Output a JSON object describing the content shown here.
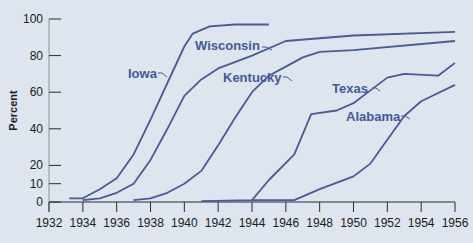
{
  "chart_data": {
    "type": "line",
    "title": "",
    "xlabel": "",
    "ylabel": "Percent",
    "xlim": [
      1932,
      1956
    ],
    "ylim": [
      0,
      100
    ],
    "x_ticks": [
      1932,
      1934,
      1936,
      1938,
      1940,
      1942,
      1944,
      1946,
      1948,
      1950,
      1952,
      1954,
      1956
    ],
    "y_ticks": [
      0,
      10,
      20,
      40,
      60,
      80,
      100
    ],
    "grid": false,
    "legend": "inline labels",
    "colors": {
      "line": "#4a5a94",
      "label": "#44589a",
      "axis": "#2a2a2a",
      "background": "#dfe5ee"
    },
    "series": [
      {
        "name": "Iowa",
        "points": [
          [
            1933.2,
            2
          ],
          [
            1934,
            2
          ],
          [
            1935,
            7
          ],
          [
            1936,
            13
          ],
          [
            1937,
            26
          ],
          [
            1938,
            45
          ],
          [
            1939,
            65
          ],
          [
            1940,
            85
          ],
          [
            1940.5,
            92
          ],
          [
            1941.5,
            96
          ],
          [
            1943,
            97
          ],
          [
            1945,
            97
          ]
        ],
        "label_pos": [
          128,
          78
        ]
      },
      {
        "name": "Wisconsin",
        "points": [
          [
            1934,
            1
          ],
          [
            1935,
            2
          ],
          [
            1936,
            5
          ],
          [
            1937,
            10
          ],
          [
            1938,
            23
          ],
          [
            1939,
            40
          ],
          [
            1940,
            58
          ],
          [
            1941,
            67
          ],
          [
            1942,
            73
          ],
          [
            1944,
            80
          ],
          [
            1946,
            88
          ],
          [
            1950,
            91
          ],
          [
            1956,
            93
          ]
        ],
        "label_pos": [
          195,
          50
        ]
      },
      {
        "name": "Kentucky",
        "points": [
          [
            1937,
            1
          ],
          [
            1938,
            2
          ],
          [
            1939,
            5
          ],
          [
            1940,
            10
          ],
          [
            1941,
            17
          ],
          [
            1942,
            31
          ],
          [
            1943,
            46
          ],
          [
            1944,
            60
          ],
          [
            1945,
            69
          ],
          [
            1946,
            74
          ],
          [
            1947,
            79
          ],
          [
            1948,
            82
          ],
          [
            1950,
            83
          ],
          [
            1956,
            88
          ]
        ],
        "label_pos": [
          223,
          82
        ]
      },
      {
        "name": "Texas",
        "points": [
          [
            1941,
            0.5
          ],
          [
            1944,
            1
          ],
          [
            1945,
            12
          ],
          [
            1946.5,
            26
          ],
          [
            1947.5,
            48
          ],
          [
            1949,
            50
          ],
          [
            1950,
            54
          ],
          [
            1951,
            61
          ],
          [
            1952,
            68
          ],
          [
            1953,
            70
          ],
          [
            1955,
            69
          ],
          [
            1956,
            76
          ]
        ],
        "label_pos": [
          332,
          93
        ]
      },
      {
        "name": "Alabama",
        "points": [
          [
            1944,
            1
          ],
          [
            1946.5,
            1
          ],
          [
            1948,
            7
          ],
          [
            1950,
            14
          ],
          [
            1951,
            21
          ],
          [
            1952,
            34
          ],
          [
            1953,
            47
          ],
          [
            1954,
            55
          ],
          [
            1956,
            64
          ]
        ],
        "label_pos": [
          346,
          121
        ]
      }
    ]
  }
}
